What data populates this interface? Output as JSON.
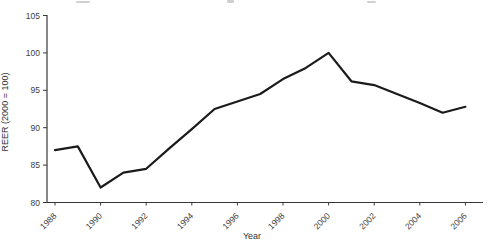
{
  "chart_data": {
    "type": "line",
    "title": "",
    "xlabel": "Year",
    "ylabel": "REER (2000 = 100)",
    "x": [
      1988,
      1989,
      1990,
      1991,
      1992,
      1993,
      1994,
      1995,
      1996,
      1997,
      1998,
      1999,
      2000,
      2001,
      2002,
      2003,
      2004,
      2005,
      2006
    ],
    "series": [
      {
        "name": "REER",
        "values": [
          87,
          87.5,
          82,
          84,
          84.5,
          87.2,
          89.8,
          92.5,
          93.5,
          94.5,
          96.5,
          98,
          100,
          96.2,
          95.7,
          94.5,
          93.3,
          92,
          92.8
        ]
      }
    ],
    "x_ticks": [
      "1988",
      "1990",
      "1992",
      "1994",
      "1996",
      "1998",
      "2000",
      "2002",
      "2004",
      "2006"
    ],
    "y_ticks": [
      80,
      85,
      90,
      95,
      100,
      105
    ],
    "xlim": [
      1988,
      2006
    ],
    "ylim": [
      80,
      105
    ],
    "grid": false,
    "legend": "none",
    "line_color": "#1b1b1b",
    "axis_color": "#383838",
    "tick_text_color": "#3d3d3d"
  }
}
